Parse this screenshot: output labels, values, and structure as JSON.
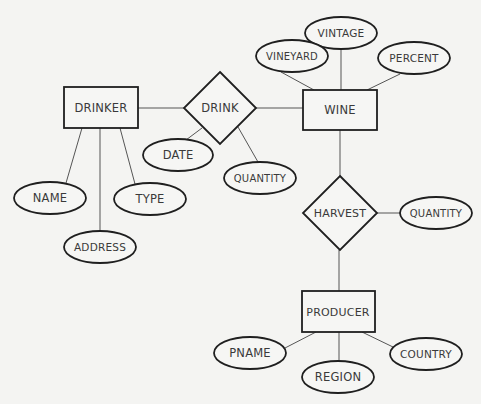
{
  "diagram": {
    "type": "entity-relationship",
    "colors": {
      "background": "#f4f4f2",
      "stroke": "#1f1f1f",
      "text": "#3a3a3a",
      "edge": "#555555"
    },
    "entities": [
      {
        "id": "drinker",
        "label": "DRINKER",
        "x": 64,
        "y": 87,
        "w": 74,
        "h": 41
      },
      {
        "id": "wine",
        "label": "WINE",
        "x": 303,
        "y": 90,
        "w": 74,
        "h": 40
      },
      {
        "id": "producer",
        "label": "PRODUCER",
        "x": 302,
        "y": 291,
        "w": 73,
        "h": 41
      }
    ],
    "relationships": [
      {
        "id": "drink",
        "label": "DRINK",
        "cx": 220,
        "cy": 108,
        "hw": 36,
        "hh": 36
      },
      {
        "id": "harvest",
        "label": "HARVEST",
        "cx": 340,
        "cy": 213,
        "hw": 37,
        "hh": 37
      }
    ],
    "attributes": [
      {
        "id": "vintage",
        "label": "VINTAGE",
        "cx": 341,
        "cy": 33,
        "owner": "wine"
      },
      {
        "id": "vineyard",
        "label": "VINEYARD",
        "cx": 292,
        "cy": 56,
        "owner": "wine"
      },
      {
        "id": "percent",
        "label": "PERCENT",
        "cx": 414,
        "cy": 58,
        "owner": "wine"
      },
      {
        "id": "date",
        "label": "DATE",
        "cx": 178,
        "cy": 155,
        "owner": "drink"
      },
      {
        "id": "drink-quantity",
        "label": "QUANTITY",
        "cx": 260,
        "cy": 178,
        "owner": "drink"
      },
      {
        "id": "name",
        "label": "NAME",
        "cx": 50,
        "cy": 198,
        "owner": "drinker"
      },
      {
        "id": "type",
        "label": "TYPE",
        "cx": 150,
        "cy": 199,
        "owner": "drinker"
      },
      {
        "id": "address",
        "label": "ADDRESS",
        "cx": 100,
        "cy": 247,
        "owner": "drinker"
      },
      {
        "id": "harvest-quantity",
        "label": "QUANTITY",
        "cx": 436,
        "cy": 213,
        "owner": "harvest"
      },
      {
        "id": "pname",
        "label": "PNAME",
        "cx": 250,
        "cy": 353,
        "owner": "producer"
      },
      {
        "id": "region",
        "label": "REGION",
        "cx": 338,
        "cy": 377,
        "owner": "producer"
      },
      {
        "id": "country",
        "label": "COUNTRY",
        "cx": 426,
        "cy": 354,
        "owner": "producer"
      }
    ],
    "edges": [
      [
        "drinker",
        "drink"
      ],
      [
        "drink",
        "wine"
      ],
      [
        "wine",
        "harvest"
      ],
      [
        "harvest",
        "producer"
      ],
      [
        "wine",
        "vintage"
      ],
      [
        "wine",
        "vineyard"
      ],
      [
        "wine",
        "percent"
      ],
      [
        "drink",
        "date"
      ],
      [
        "drink",
        "drink-quantity"
      ],
      [
        "drinker",
        "name"
      ],
      [
        "drinker",
        "type"
      ],
      [
        "drinker",
        "address"
      ],
      [
        "harvest",
        "harvest-quantity"
      ],
      [
        "producer",
        "pname"
      ],
      [
        "producer",
        "region"
      ],
      [
        "producer",
        "country"
      ]
    ]
  }
}
